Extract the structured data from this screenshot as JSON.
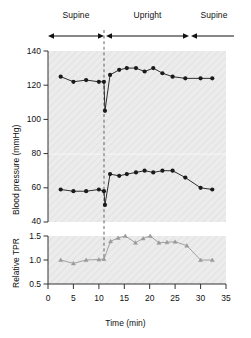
{
  "figure": {
    "background": "#ffffff",
    "plot_background": "#ececed",
    "series_color_bp": "#1a1a1a",
    "series_color_tpr": "#9a9a9a"
  },
  "phases": [
    {
      "name": "phase-supine-1",
      "label": "Supine",
      "t_start": 0,
      "t_end": 11
    },
    {
      "name": "phase-upright",
      "label": "Upright",
      "t_start": 11,
      "t_end": 28
    },
    {
      "name": "phase-supine-2",
      "label": "Supine",
      "t_start": 28,
      "t_end": 35
    }
  ],
  "annotations": {
    "systolic_label": "systolic\npressure",
    "systolic_label_line1": "systolic",
    "systolic_label_line2": "pressure",
    "diastolic_label_line1": "diastolic",
    "diastolic_label_line2": "pressure",
    "event_line_t": 11
  },
  "chart_data": [
    {
      "type": "line",
      "name": "blood-pressure-panel",
      "title": "",
      "xlabel": "Time (min)",
      "ylabel": "Blood pressure (mmHg)",
      "xlim": [
        0,
        35
      ],
      "ylim": [
        40,
        140
      ],
      "xticks": [
        0,
        5,
        10,
        15,
        20,
        25,
        30,
        35
      ],
      "yticks": [
        40,
        60,
        80,
        100,
        120,
        140
      ],
      "grid": false,
      "legend": "inline-annotations",
      "series": [
        {
          "name": "systolic pressure",
          "color": "#1a1a1a",
          "marker": "circle",
          "x": [
            2.5,
            5.0,
            7.5,
            10.0,
            11.0,
            11.2,
            12.2,
            14.0,
            15.5,
            17.3,
            19.0,
            20.7,
            22.5,
            24.5,
            27.0,
            30.0,
            32.3
          ],
          "y": [
            125,
            122,
            123,
            122,
            122,
            105,
            126,
            129,
            130,
            130,
            128,
            130,
            127,
            125,
            124,
            124,
            124
          ]
        },
        {
          "name": "diastolic pressure",
          "color": "#1a1a1a",
          "marker": "circle",
          "x": [
            2.5,
            5.0,
            7.5,
            10.0,
            11.0,
            11.2,
            12.2,
            14.0,
            15.5,
            17.3,
            19.0,
            20.7,
            22.5,
            24.5,
            27.0,
            30.0,
            32.3
          ],
          "y": [
            59,
            58,
            58,
            59,
            58,
            50,
            68,
            67,
            68,
            69,
            70,
            69,
            70,
            70,
            66,
            60,
            59
          ]
        }
      ]
    },
    {
      "type": "line",
      "name": "relative-tpr-panel",
      "title": "",
      "xlabel": "Time (min)",
      "ylabel": "Relative TPR",
      "xlim": [
        0,
        35
      ],
      "ylim": [
        0.5,
        1.5
      ],
      "xticks": [
        0,
        5,
        10,
        15,
        20,
        25,
        30,
        35
      ],
      "yticks": [
        0.5,
        1.0,
        1.5
      ],
      "grid": false,
      "series": [
        {
          "name": "Relative TPR",
          "color": "#9a9a9a",
          "marker": "triangle",
          "x": [
            2.5,
            5.0,
            7.5,
            10.0,
            11.0,
            12.3,
            13.8,
            15.2,
            17.2,
            18.7,
            20.1,
            21.8,
            23.4,
            25.0,
            27.3,
            30.0,
            32.3
          ],
          "y": [
            1.0,
            0.93,
            1.0,
            1.01,
            1.02,
            1.39,
            1.46,
            1.5,
            1.36,
            1.45,
            1.5,
            1.36,
            1.37,
            1.38,
            1.3,
            1.0,
            1.0
          ]
        }
      ]
    }
  ]
}
